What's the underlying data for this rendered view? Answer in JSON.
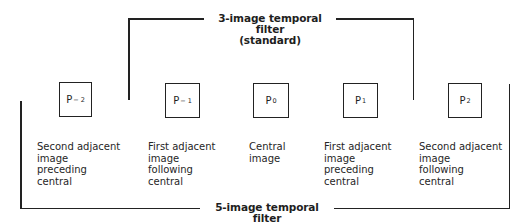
{
  "diagram": {
    "top_bracket": {
      "title_line1": "3-image temporal filter",
      "title_line2": "(standard)"
    },
    "bottom_bracket": {
      "title": "5-image temporal filter"
    },
    "images": [
      {
        "label": "P",
        "subscript": "− 2",
        "description": [
          "Second adjacent",
          "image",
          "preceding",
          "central"
        ]
      },
      {
        "label": "P",
        "subscript": "− 1",
        "description": [
          "First adjacent",
          "image",
          "following",
          "central"
        ]
      },
      {
        "label": "P",
        "subscript": "0",
        "description": [
          "Central",
          "image"
        ]
      },
      {
        "label": "P",
        "subscript": "1",
        "description": [
          "First adjacent",
          "image",
          "preceding",
          "central"
        ]
      },
      {
        "label": "P",
        "subscript": "2",
        "description": [
          "Second adjacent",
          "image",
          "following",
          "central"
        ]
      }
    ],
    "colors": {
      "line": "#222222",
      "text": "#1e1e1e",
      "background": "#ffffff"
    }
  }
}
